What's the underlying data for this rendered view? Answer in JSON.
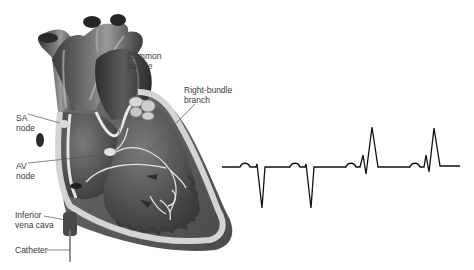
{
  "diagram": {
    "type": "anatomical-illustration-with-ecg",
    "labels": [
      {
        "id": "common-bundle",
        "lines": [
          "Common",
          "bundle"
        ]
      },
      {
        "id": "right-bundle-branch",
        "lines": [
          "Right-bundle",
          "branch"
        ]
      },
      {
        "id": "sa-node",
        "lines": [
          "SA",
          "node"
        ]
      },
      {
        "id": "av-node",
        "lines": [
          "AV",
          "node"
        ]
      },
      {
        "id": "inferior-vena-cava",
        "lines": [
          "Inferior",
          "vena cava"
        ]
      },
      {
        "id": "catheter",
        "lines": [
          "Catheter"
        ]
      }
    ],
    "ecg": {
      "description": "Electrogram trace: two complexes with deep negative deflections followed by two complexes with tall positive spikes",
      "beats": [
        {
          "p_wave": true,
          "qrs": "negative"
        },
        {
          "p_wave": true,
          "qrs": "negative"
        },
        {
          "p_wave": true,
          "qrs": "positive"
        },
        {
          "p_wave": true,
          "qrs": "positive"
        }
      ],
      "color": "#111111"
    },
    "colors": {
      "heart_dark": "#3c3c3c",
      "heart_mid": "#5a5a5a",
      "heart_light": "#8a8a8a",
      "septum_wall": "#cfcfcf",
      "conduction": "#e6e6e6",
      "label_text": "#3a3a3a",
      "leader_line": "#555555"
    }
  }
}
